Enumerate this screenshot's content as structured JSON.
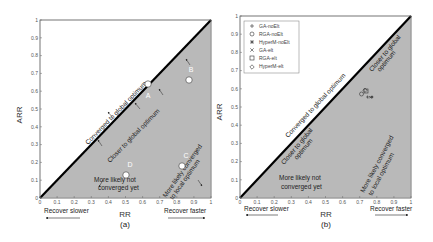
{
  "colors": {
    "shade": "#b9b9b9",
    "diag": "#000000",
    "axis": "#666666",
    "marker": "#ffffff"
  },
  "chart_data": [
    {
      "type": "scatter",
      "panel": "(a)",
      "xlabel": "RR",
      "ylabel": "ARR",
      "xlim": [
        0,
        1
      ],
      "ylim": [
        0,
        1
      ],
      "xticks": [
        "0",
        "0.1",
        "0.2",
        "0.3",
        "0.4",
        "0.5",
        "0.6",
        "0.7",
        "0.8",
        "0.9",
        "1"
      ],
      "yticks": [
        "0",
        "0.1",
        "0.2",
        "0.3",
        "0.4",
        "0.5",
        "0.6",
        "0.7",
        "0.8",
        "0.9",
        "1"
      ],
      "points": [
        {
          "label": "A",
          "x": 0.63,
          "y": 0.64
        },
        {
          "label": "B",
          "x": 0.87,
          "y": 0.66
        },
        {
          "label": "C",
          "x": 0.83,
          "y": 0.18
        },
        {
          "label": "D",
          "x": 0.5,
          "y": 0.13
        }
      ],
      "annotations": [
        "Converged to global optimum",
        "Closer to global optimum",
        "More likely not converged yet",
        "More likely converged to local optimum",
        "Recover slower",
        "Recover faster"
      ],
      "shaded_region": "below diagonal y = x"
    },
    {
      "type": "scatter",
      "panel": "(b)",
      "xlabel": "RR",
      "ylabel": "ARR",
      "xlim": [
        0,
        1
      ],
      "ylim": [
        0,
        1
      ],
      "xticks": [
        "0",
        "0.1",
        "0.2",
        "0.3",
        "0.4",
        "0.5",
        "0.6",
        "0.7",
        "0.8",
        "0.9",
        "1"
      ],
      "yticks": [
        "0",
        "0.1",
        "0.2",
        "0.3",
        "0.4",
        "0.5",
        "0.6",
        "0.7",
        "0.8",
        "0.9",
        "1"
      ],
      "legend": [
        "GA-noElt",
        "RGA-noElt",
        "HyperM-noElt",
        "GA-elt",
        "RGA-elt",
        "HyperM-elt"
      ],
      "legend_position": "upper left",
      "series": [
        {
          "name": "GA-noElt",
          "marker": "+",
          "x": 0.74,
          "y": 0.56
        },
        {
          "name": "RGA-noElt",
          "marker": "o",
          "x": 0.71,
          "y": 0.58
        },
        {
          "name": "HyperM-noElt",
          "marker": "*",
          "x": 0.77,
          "y": 0.56
        },
        {
          "name": "GA-elt",
          "marker": "x",
          "x": 0.76,
          "y": 0.56
        },
        {
          "name": "RGA-elt",
          "marker": "s",
          "x": 0.74,
          "y": 0.59
        },
        {
          "name": "HyperM-elt",
          "marker": "d",
          "x": 0.72,
          "y": 0.59
        }
      ],
      "annotations": [
        "Converged to global optimum",
        "Closer to global optimum",
        "Closer to global optimum",
        "More likely not converged yet",
        "More likely converged to local optimum",
        "Recover slower",
        "Recover faster"
      ],
      "shaded_region": "below diagonal y = x"
    }
  ],
  "panels": {
    "a": {
      "caption": "(a)",
      "xlabel": "RR",
      "ylabel": "ARR",
      "ann_converged": "Converged to global optimum",
      "ann_closer": "Closer to global optimum",
      "ann_notconv1": "More likely not",
      "ann_notconv2": "converged yet",
      "ann_local1": "More likely converged",
      "ann_local2": "to local optimum",
      "recover_slower": "Recover slower",
      "recover_faster": "Recover faster",
      "pt_a": "A",
      "pt_b": "B",
      "pt_c": "C",
      "pt_d": "D"
    },
    "b": {
      "caption": "(b)",
      "xlabel": "RR",
      "ylabel": "ARR",
      "ann_converged": "Converged to global optimum",
      "ann_closer_top1": "Closer to global",
      "ann_closer_top2": "optimum",
      "ann_closer_low1": "Closer to global",
      "ann_closer_low2": "optimum",
      "ann_notconv1": "More likely not",
      "ann_notconv2": "converged yet",
      "ann_local1": "More likely converged",
      "ann_local2": "to local optimum",
      "recover_slower": "Recover slower",
      "recover_faster": "Recover faster",
      "legend": [
        "GA-noElt",
        "RGA-noElt",
        "HyperM-noElt",
        "GA-elt",
        "RGA-elt",
        "HyperM-elt"
      ]
    }
  },
  "ticks": [
    "0",
    "0.1",
    "0.2",
    "0.3",
    "0.4",
    "0.5",
    "0.6",
    "0.7",
    "0.8",
    "0.9",
    "1"
  ]
}
